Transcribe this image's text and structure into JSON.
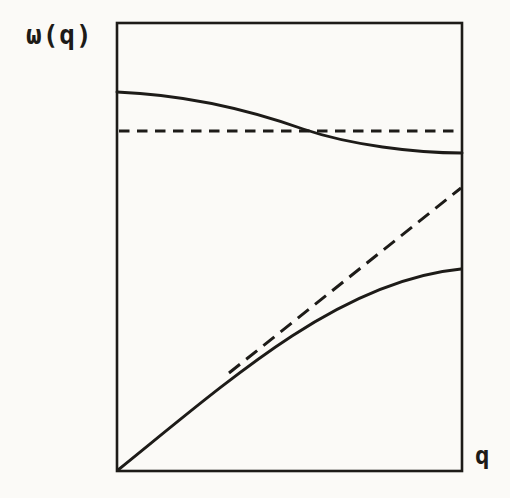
{
  "figure": {
    "y_axis_label": "ω(q)",
    "x_axis_label": "q"
  },
  "colors": {
    "ink": "#1d1b18",
    "paper": "#fbfaf7"
  },
  "curves": {
    "optical_branch": {
      "label": "optical-branch",
      "style": "solid"
    },
    "acoustic_branch": {
      "label": "acoustic-branch",
      "style": "solid"
    },
    "flat_reference": {
      "label": "flat-dashed-reference",
      "style": "dashed"
    },
    "linear_reference": {
      "label": "linear-dashed-reference",
      "style": "dashed"
    }
  }
}
